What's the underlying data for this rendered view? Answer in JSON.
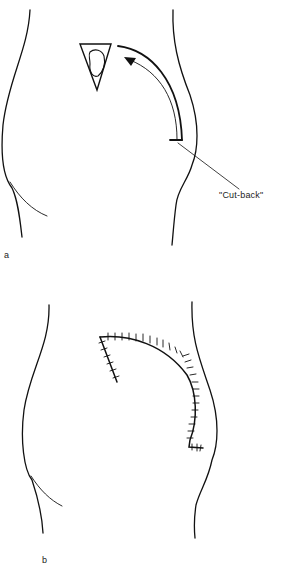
{
  "figure_a": {
    "label": "a",
    "callout": "\"Cut-back\"",
    "elements": [
      "body-outline-left",
      "body-outline-right",
      "triangular-defect",
      "curved-flap-incision",
      "rotation-arrow",
      "cut-back-leader-line"
    ]
  },
  "figure_b": {
    "label": "b",
    "elements": [
      "body-outline-left",
      "body-outline-right",
      "sutured-flap-closure"
    ]
  },
  "colors": {
    "line": "#111111",
    "background": "#ffffff"
  }
}
